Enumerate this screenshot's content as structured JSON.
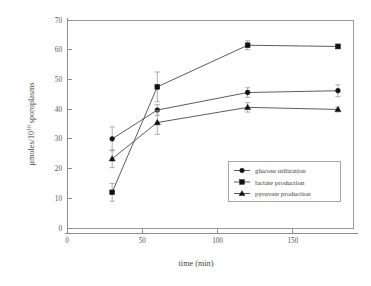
{
  "chart_data": {
    "type": "line",
    "title": "",
    "subtitle": "",
    "xlabel": "time (min)",
    "ylabel": "µmoles/10",
    "ylabel_exponent": "10",
    "ylabel_tail": " sporoplasms",
    "x": [
      30,
      60,
      120,
      180
    ],
    "xlim": [
      0,
      190
    ],
    "ylim": [
      0,
      70
    ],
    "xticks": [
      0,
      50,
      100,
      150
    ],
    "xtick_labels": [
      "0",
      "50",
      "100",
      "150"
    ],
    "yticks": [
      0,
      10,
      20,
      30,
      40,
      50,
      60,
      70
    ],
    "ytick_labels": [
      "0",
      "10",
      "20",
      "30",
      "40",
      "50",
      "60",
      "70"
    ],
    "grid": false,
    "legend_position": "lower right",
    "error_type": "error bars",
    "series": [
      {
        "name": "glucose utilization",
        "marker": "circle",
        "color": "#111111",
        "values": [
          30.0,
          39.7,
          45.6,
          46.2
        ],
        "errors": [
          4.0,
          1.8,
          1.6,
          2.0
        ]
      },
      {
        "name": "lactate production",
        "marker": "square",
        "color": "#111111",
        "values": [
          12.0,
          47.5,
          61.5,
          61.1
        ],
        "errors": [
          3.0,
          5.0,
          1.5,
          0.8
        ]
      },
      {
        "name": "pyruvate production",
        "marker": "triangle",
        "color": "#111111",
        "values": [
          23.3,
          35.5,
          40.6,
          39.9
        ],
        "errors": [
          3.0,
          4.0,
          1.6,
          0.8
        ]
      }
    ]
  },
  "legend": {
    "entries": [
      {
        "label": "glucose utilization",
        "marker": "circle"
      },
      {
        "label": "lactate production",
        "marker": "square"
      },
      {
        "label": "pyruvate production",
        "marker": "triangle"
      }
    ]
  },
  "axes": {
    "x_title": "time (min)",
    "y_title_prefix": "µmoles/10",
    "y_title_exponent": "10",
    "y_title_suffix": " sporoplasms"
  }
}
